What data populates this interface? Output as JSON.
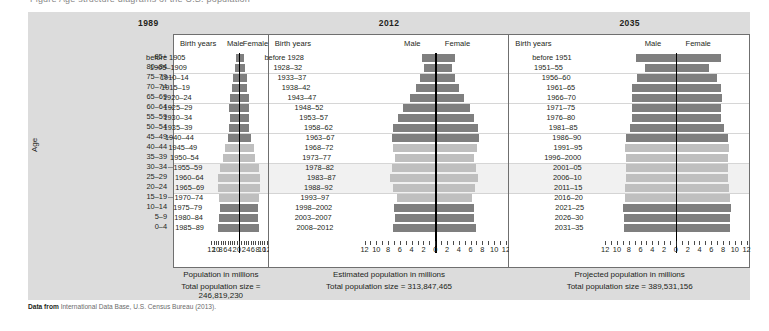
{
  "top_clipped_text": "Figure  Age structure diagrams of the U.S. population",
  "axis_label_age": "Age",
  "source": {
    "prefix": "Data from",
    "text": "International Data Base, U.S. Census Bureau (2013)."
  },
  "age_groups": [
    "85+",
    "80–84",
    "75–79",
    "70–74",
    "65–69",
    "60–64",
    "55–59",
    "50–54",
    "45–49",
    "40–44",
    "35–39",
    "30–34",
    "25–29",
    "20–24",
    "15–19",
    "10–14",
    "5–9",
    "0–4"
  ],
  "column_headers": {
    "birth_years": "Birth years",
    "male": "Male",
    "female": "Female"
  },
  "axis": {
    "ticks": [
      12,
      10,
      8,
      6,
      4,
      2,
      0,
      2,
      4,
      6,
      8,
      10,
      12
    ],
    "max": 12,
    "unit": "millions"
  },
  "chart_data": {
    "type": "bar",
    "title": "Age structure diagrams of the U.S. population",
    "xlabel": "Population in millions",
    "ylabel": "Age",
    "xlim": [
      -12,
      12
    ],
    "grid": false,
    "legend": "none",
    "categories": [
      "85+",
      "80–84",
      "75–79",
      "70–74",
      "65–69",
      "60–64",
      "55–59",
      "50–54",
      "45–49",
      "40–44",
      "35–39",
      "30–34",
      "25–29",
      "20–24",
      "15–19",
      "10–14",
      "5–9",
      "0–4"
    ],
    "panels": [
      {
        "year": "1989",
        "xlabel": "Population in millions",
        "total_label": "Total population size = 246,819,230",
        "total_value": 246819230,
        "birth_years": [
          "before 1905",
          "1905–1909",
          "1910–14",
          "1915–19",
          "1920–24",
          "1925–29",
          "1930–34",
          "1935–39",
          "1940–44",
          "1945–49",
          "1950–54",
          "1955–59",
          "1960–64",
          "1965–69",
          "1970–74",
          "1975–79",
          "1980–84",
          "1985–89"
        ],
        "shade": [
          "dark",
          "dark",
          "dark",
          "dark",
          "dark",
          "dark",
          "dark",
          "dark",
          "dark",
          "light",
          "light",
          "light",
          "light",
          "light",
          "light",
          "dark",
          "dark",
          "dark"
        ],
        "male": [
          1.2,
          1.8,
          2.6,
          3.1,
          3.9,
          4.2,
          4.1,
          4.2,
          4.8,
          6.3,
          7.0,
          8.5,
          9.1,
          9.3,
          8.9,
          8.4,
          8.8,
          9.2
        ],
        "female": [
          2.2,
          2.6,
          3.3,
          3.6,
          4.2,
          4.4,
          4.3,
          4.4,
          5.0,
          6.4,
          7.1,
          8.5,
          9.0,
          9.2,
          8.7,
          8.1,
          8.4,
          8.8
        ]
      },
      {
        "year": "2012",
        "xlabel": "Estimated population in millions",
        "total_label": "Total population size = 313,847,465",
        "total_value": 313847465,
        "birth_years": [
          "before 1928",
          "1928–32",
          "1933–37",
          "1938–42",
          "1943–47",
          "1948–52",
          "1953–57",
          "1958–62",
          "1963–67",
          "1968–72",
          "1973–77",
          "1978–82",
          "1983–87",
          "1988–92",
          "1993–97",
          "1998–2002",
          "2003–2007",
          "2008–2012"
        ],
        "shade": [
          "dark",
          "dark",
          "dark",
          "dark",
          "dark",
          "dark",
          "dark",
          "dark",
          "dark",
          "light",
          "light",
          "light",
          "light",
          "light",
          "light",
          "dark",
          "dark",
          "dark"
        ],
        "male": [
          2.2,
          1.9,
          2.6,
          3.3,
          4.3,
          5.5,
          6.3,
          7.1,
          7.4,
          7.2,
          6.8,
          7.3,
          7.6,
          7.1,
          6.5,
          7.0,
          6.9,
          7.2
        ],
        "female": [
          3.3,
          2.8,
          3.4,
          4.0,
          4.8,
          5.9,
          6.6,
          7.2,
          7.5,
          7.1,
          6.6,
          7.0,
          7.3,
          6.8,
          6.2,
          6.6,
          6.6,
          6.9
        ]
      },
      {
        "year": "2035",
        "xlabel": "Projected population in millions",
        "total_label": "Total population size = 389,531,156",
        "total_value": 389531156,
        "birth_years": [
          "before 1951",
          "1951–55",
          "1956–60",
          "1961–65",
          "1966–70",
          "1971–75",
          "1976–80",
          "1981–85",
          "1986–90",
          "1991–95",
          "1996–2000",
          "2001–05",
          "2006–10",
          "2011–15",
          "2016–20",
          "2021–25",
          "2026–30",
          "2031–35"
        ],
        "shade": [
          "dark",
          "dark",
          "dark",
          "dark",
          "dark",
          "dark",
          "dark",
          "dark",
          "dark",
          "light",
          "light",
          "light",
          "light",
          "light",
          "light",
          "dark",
          "dark",
          "dark"
        ],
        "male": [
          6.8,
          5.3,
          6.6,
          7.4,
          7.5,
          7.4,
          7.4,
          7.8,
          8.4,
          8.6,
          8.4,
          8.5,
          8.5,
          8.6,
          8.7,
          8.9,
          8.8,
          8.8
        ],
        "female": [
          7.6,
          5.7,
          7.0,
          7.7,
          7.8,
          7.7,
          7.7,
          8.1,
          8.8,
          9.0,
          8.8,
          8.9,
          8.9,
          9.0,
          9.1,
          9.3,
          9.2,
          9.2
        ]
      }
    ]
  }
}
